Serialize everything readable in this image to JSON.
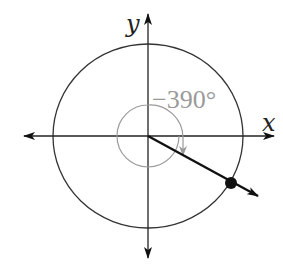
{
  "diagram": {
    "type": "angle-in-standard-position",
    "axes": {
      "x_label": "x",
      "y_label": "y"
    },
    "angle": {
      "label": "−390°",
      "degrees": -390,
      "direction": "clockwise",
      "terminal_side_quadrant": "IV"
    },
    "unit_circle": true,
    "terminal_point": "marked"
  },
  "colors": {
    "axis": "#222222",
    "circle": "#333333",
    "terminal_ray": "#111111",
    "angle_arc": "#9a9a9a",
    "angle_label": "#9a9a9a"
  }
}
